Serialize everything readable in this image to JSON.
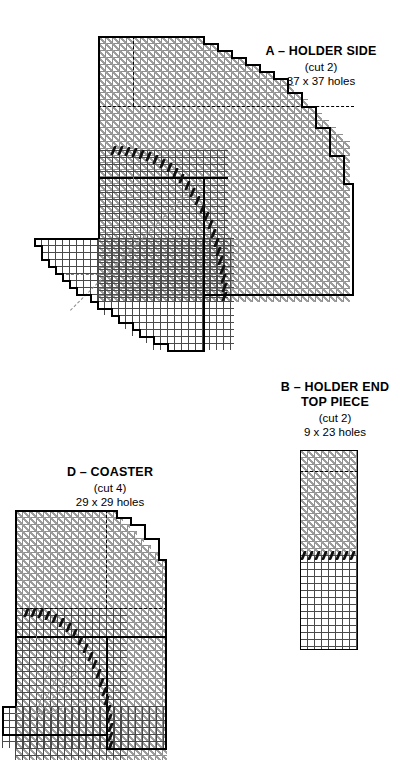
{
  "document": {
    "type": "plastic-canvas-stitch-pattern",
    "background_color": "#ffffff",
    "ink_color": "#000000",
    "stitch_color": "#9d9d9d",
    "accent_stitch_color": "#111111"
  },
  "pieces": [
    {
      "key": "A",
      "title": "A – HOLDER SIDE",
      "cut": "(cut 2)",
      "size": "37 x 37 holes",
      "holes_wide": 37,
      "holes_high": 37
    },
    {
      "key": "B",
      "title_line1": "B – HOLDER END",
      "title_line2": "TOP PIECE",
      "cut": "(cut 2)",
      "size": "9 x 23 holes",
      "holes_wide": 9,
      "holes_high": 23
    },
    {
      "key": "D",
      "title": "D – COASTER",
      "cut": "(cut 4)",
      "size": "29 x 29 holes",
      "holes_wide": 29,
      "holes_high": 29
    }
  ]
}
